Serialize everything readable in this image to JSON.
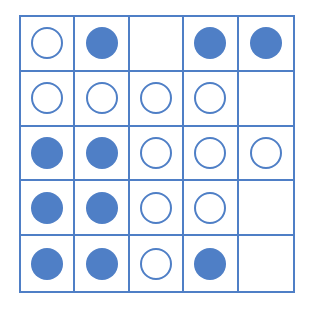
{
  "colors": {
    "accent": "#4f7fc6",
    "background": "#ffffff"
  },
  "grid": {
    "rows": 5,
    "cols": 5,
    "cells": [
      [
        "empty",
        "filled",
        "none",
        "filled",
        "filled"
      ],
      [
        "empty",
        "empty",
        "empty",
        "empty",
        "none"
      ],
      [
        "filled",
        "filled",
        "empty",
        "empty",
        "empty"
      ],
      [
        "filled",
        "filled",
        "empty",
        "empty",
        "none"
      ],
      [
        "filled",
        "filled",
        "empty",
        "filled",
        "none"
      ]
    ]
  }
}
